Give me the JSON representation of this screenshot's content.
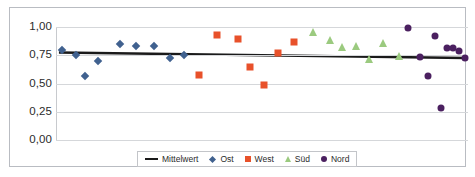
{
  "chart_data": {
    "type": "scatter",
    "title": "",
    "xlabel": "",
    "ylabel": "",
    "ylim": [
      0.0,
      1.0
    ],
    "xlim": [
      0,
      42
    ],
    "grid": true,
    "legend_position": "bottom",
    "ytick_labels": [
      "1,00",
      "0,75",
      "0,50",
      "0,25",
      "0,00"
    ],
    "ytick_values": [
      1.0,
      0.75,
      0.5,
      0.25,
      0.0
    ],
    "series": [
      {
        "name": "Mittelwert",
        "marker": "line",
        "color": "#1a1a1a",
        "type": "line",
        "x": [
          0.3,
          41.7
        ],
        "values": [
          0.775,
          0.725
        ]
      },
      {
        "name": "Ost",
        "marker": "diamond",
        "color": "#40618F",
        "x": [
          0.6,
          2.0,
          3.0,
          4.3,
          6.5,
          8.2,
          10.0,
          11.6,
          13.0
        ],
        "values": [
          0.8,
          0.755,
          0.57,
          0.7,
          0.85,
          0.83,
          0.83,
          0.73,
          0.75
        ]
      },
      {
        "name": "West",
        "marker": "square",
        "color": "#E8512A",
        "x": [
          14.6,
          16.4,
          18.6,
          19.8,
          21.2,
          22.6,
          24.3
        ],
        "values": [
          0.575,
          0.925,
          0.89,
          0.645,
          0.49,
          0.77,
          0.87
        ]
      },
      {
        "name": "Süd",
        "marker": "triangle",
        "color": "#9BCA7F",
        "x": [
          26.2,
          27.9,
          29.2,
          30.6,
          31.9,
          33.3,
          35.0
        ],
        "values": [
          0.96,
          0.885,
          0.82,
          0.83,
          0.715,
          0.86,
          0.74
        ]
      },
      {
        "name": "Nord",
        "marker": "circle",
        "color": "#4B2060",
        "x": [
          35.9,
          37.1,
          37.9,
          38.6,
          39.2,
          39.9,
          40.5,
          41.1,
          41.7
        ],
        "values": [
          0.99,
          0.735,
          0.57,
          0.92,
          0.285,
          0.81,
          0.81,
          0.79,
          0.73
        ]
      }
    ]
  },
  "legend": {
    "items": [
      {
        "label": "Mittelwert",
        "marker": "line",
        "color": "#1a1a1a"
      },
      {
        "label": "Ost",
        "marker": "diamond",
        "color": "#40618F"
      },
      {
        "label": "West",
        "marker": "square",
        "color": "#E8512A"
      },
      {
        "label": "Süd",
        "marker": "triangle",
        "color": "#9BCA7F"
      },
      {
        "label": "Nord",
        "marker": "circle",
        "color": "#4B2060"
      }
    ]
  }
}
